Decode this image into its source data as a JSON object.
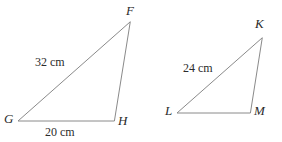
{
  "figure": {
    "background_color": "#ffffff",
    "stroke_color": "#8a8a8a",
    "text_color": "#2b2b2b",
    "triangles": [
      {
        "id": "triangle-fgh",
        "name": "triangle-fgh",
        "vertices": [
          {
            "label": "F",
            "x": 130,
            "y": 22,
            "label_x": 126,
            "label_y": 4
          },
          {
            "label": "G",
            "x": 18,
            "y": 121,
            "label_x": 4,
            "label_y": 112
          },
          {
            "label": "H",
            "x": 114,
            "y": 121,
            "label_x": 118,
            "label_y": 114
          }
        ],
        "measures": [
          {
            "text": "32 cm",
            "x": 35,
            "y": 56,
            "side": "GF"
          },
          {
            "text": "20 cm",
            "x": 45,
            "y": 126,
            "side": "GH"
          }
        ]
      },
      {
        "id": "triangle-klm",
        "name": "triangle-klm",
        "vertices": [
          {
            "label": "K",
            "x": 262,
            "y": 38,
            "label_x": 255,
            "label_y": 17
          },
          {
            "label": "L",
            "x": 177,
            "y": 113,
            "label_x": 165,
            "label_y": 104
          },
          {
            "label": "M",
            "x": 250,
            "y": 113,
            "label_x": 254,
            "label_y": 104
          }
        ],
        "measures": [
          {
            "text": "24 cm",
            "x": 183,
            "y": 62,
            "side": "LK"
          }
        ]
      }
    ]
  }
}
